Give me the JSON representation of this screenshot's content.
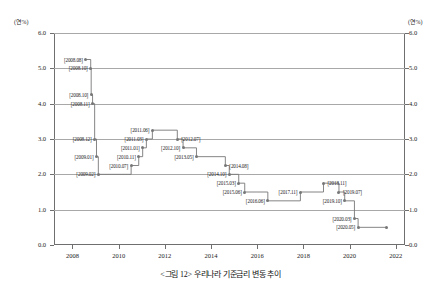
{
  "chart_data": {
    "type": "line",
    "subtype": "step",
    "title": "",
    "xlabel": "",
    "ylabel": "",
    "unit_label_left": "(연%)",
    "unit_label_right": "(연%)",
    "xlim": [
      2007.2,
      2022.4
    ],
    "ylim": [
      0.0,
      6.0
    ],
    "xticks": [
      "2008",
      "2010",
      "2012",
      "2014",
      "2016",
      "2018",
      "2020",
      "2022"
    ],
    "xtick_values": [
      2008,
      2010,
      2012,
      2014,
      2016,
      2018,
      2020,
      2022
    ],
    "yticks": [
      "0.0",
      "1.0",
      "2.0",
      "3.0",
      "4.0",
      "5.0",
      "6.0"
    ],
    "ytick_values": [
      0.0,
      1.0,
      2.0,
      3.0,
      4.0,
      5.0,
      6.0
    ],
    "grid": "horizontal",
    "legend": "none",
    "series": [
      {
        "name": "기준금리",
        "color": "#777777",
        "points": [
          {
            "label": "[2008.08]",
            "x": 2008.58,
            "y": 5.25,
            "side": "r"
          },
          {
            "label": "[2008.10]",
            "x": 2008.79,
            "y": 5.0,
            "side": "r"
          },
          {
            "label": "[2008.10]",
            "x": 2008.81,
            "y": 4.25,
            "side": "r"
          },
          {
            "label": "[2008.11]",
            "x": 2008.87,
            "y": 4.0,
            "side": "r"
          },
          {
            "label": "[2008.12]",
            "x": 2008.96,
            "y": 3.0,
            "side": "r"
          },
          {
            "label": "[2009.01]",
            "x": 2009.04,
            "y": 2.5,
            "side": "r"
          },
          {
            "label": "[2009.02]",
            "x": 2009.12,
            "y": 2.0,
            "side": "r"
          },
          {
            "label": "[2010.07]",
            "x": 2010.54,
            "y": 2.25,
            "side": "r"
          },
          {
            "label": "[2010.11]",
            "x": 2010.87,
            "y": 2.5,
            "side": "r"
          },
          {
            "label": "[2011.01]",
            "x": 2011.04,
            "y": 2.75,
            "side": "r"
          },
          {
            "label": "[2011.03]",
            "x": 2011.2,
            "y": 3.0,
            "side": "r"
          },
          {
            "label": "[2011.06]",
            "x": 2011.46,
            "y": 3.25,
            "side": "r"
          },
          {
            "label": "[2012.07]",
            "x": 2012.54,
            "y": 3.0,
            "side": "l"
          },
          {
            "label": "[2012.10]",
            "x": 2012.79,
            "y": 2.75,
            "side": "r"
          },
          {
            "label": "[2013.05]",
            "x": 2013.37,
            "y": 2.5,
            "side": "r"
          },
          {
            "label": "[2014.08]",
            "x": 2014.62,
            "y": 2.25,
            "side": "l"
          },
          {
            "label": "[2014.10]",
            "x": 2014.79,
            "y": 2.0,
            "side": "r"
          },
          {
            "label": "[2015.03]",
            "x": 2015.2,
            "y": 1.75,
            "side": "r"
          },
          {
            "label": "[2015.06]",
            "x": 2015.46,
            "y": 1.5,
            "side": "r"
          },
          {
            "label": "[2016.06]",
            "x": 2016.46,
            "y": 1.25,
            "side": "r"
          },
          {
            "label": "[2017.11]",
            "x": 2017.87,
            "y": 1.5,
            "side": "r"
          },
          {
            "label": "[2018.11]",
            "x": 2018.87,
            "y": 1.75,
            "side": "l"
          },
          {
            "label": "[2019.07]",
            "x": 2019.54,
            "y": 1.5,
            "side": "l"
          },
          {
            "label": "[2019.10]",
            "x": 2019.79,
            "y": 1.25,
            "side": "r"
          },
          {
            "label": "[2020.03]",
            "x": 2020.21,
            "y": 0.75,
            "side": "r"
          },
          {
            "label": "[2020.05]",
            "x": 2020.37,
            "y": 0.5,
            "side": "r"
          },
          {
            "label": "",
            "x": 2021.6,
            "y": 0.5,
            "side": "r"
          }
        ]
      }
    ]
  },
  "caption": {
    "text": "<그림 12> 우리나라 기준금리 변동 추이"
  }
}
